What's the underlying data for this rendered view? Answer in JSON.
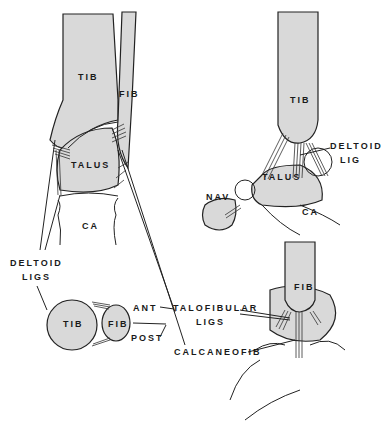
{
  "figure": {
    "panels": [
      {
        "id": "anterior-view",
        "labels": {
          "tibia": "TIB",
          "fibula": "FIB",
          "talus": "TALUS",
          "calcaneus": "CA"
        }
      },
      {
        "id": "medial-view",
        "labels": {
          "tibia": "TIB",
          "talus": "TALUS",
          "navicular": "NAV",
          "calcaneus": "CA",
          "ligament": "DELTOID",
          "ligament_line2": "LIG"
        }
      },
      {
        "id": "axial-view",
        "labels": {
          "tibia": "TIB",
          "fibula": "FIB",
          "anterior": "ANT",
          "posterior": "POST",
          "deltoid": "DELTOID",
          "deltoid_line2": "LIGS"
        }
      },
      {
        "id": "lateral-view",
        "labels": {
          "fibula": "FIB"
        }
      }
    ],
    "callouts": {
      "talofibular": "TALOFIBULAR",
      "talofibular_line2": "LIGS",
      "calcaneofib": "CALCANEOFIB"
    },
    "colors": {
      "bone_fill": "#d9d9d9",
      "line": "#222222",
      "background": "#ffffff"
    }
  }
}
